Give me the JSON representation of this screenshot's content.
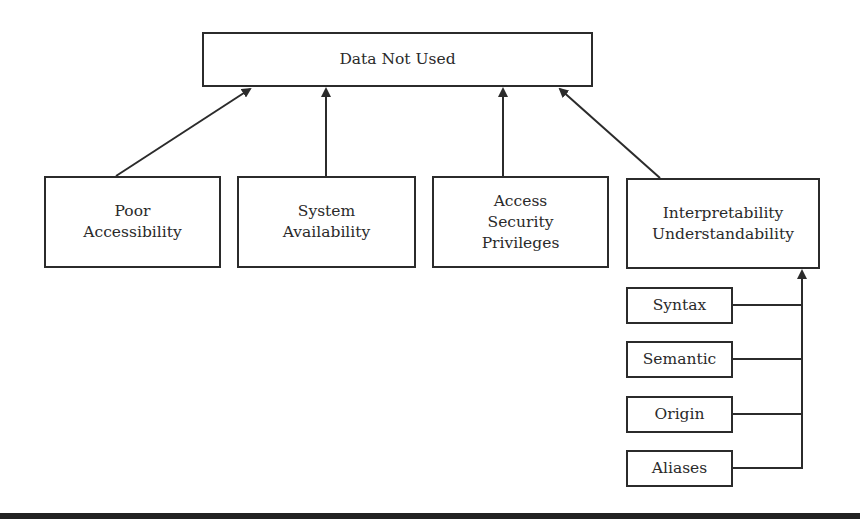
{
  "diagram": {
    "root": {
      "label": "Data Not Used"
    },
    "causes": [
      {
        "lines": [
          "Poor",
          "Accessibility"
        ]
      },
      {
        "lines": [
          "System",
          "Availability"
        ]
      },
      {
        "lines": [
          "Access",
          "Security",
          "Privileges"
        ]
      },
      {
        "lines": [
          "Interpretability",
          "Understandability"
        ]
      }
    ],
    "sub_factors": [
      {
        "label": "Syntax"
      },
      {
        "label": "Semantic"
      },
      {
        "label": "Origin"
      },
      {
        "label": "Aliases"
      }
    ],
    "colors": {
      "stroke": "#2b2b2b",
      "background": "#ffffff",
      "text": "#2a2a2a"
    }
  }
}
